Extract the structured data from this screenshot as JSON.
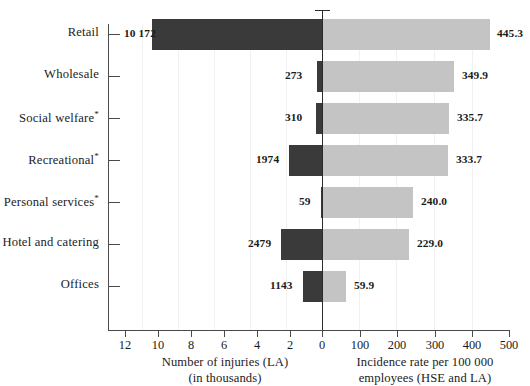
{
  "chart_data": {
    "type": "bar",
    "subtype": "bidirectional-tornado",
    "title": "",
    "categories": [
      "Retail",
      "Wholesale",
      "Social welfare*",
      "Recreational*",
      "Personal services*",
      "Hotel and catering",
      "Offices"
    ],
    "series": [
      {
        "name": "Number of injuries (LA)",
        "side": "left",
        "unit": "thousands",
        "color": "#3a3a3a",
        "values": [
          10172,
          273,
          310,
          1974,
          59,
          2479,
          1143
        ],
        "value_labels": [
          "10 172",
          "273",
          "310",
          "1974",
          "59",
          "2479",
          "1143"
        ],
        "axis_values_thousands": [
          10.172,
          0.273,
          0.31,
          1.974,
          0.059,
          2.479,
          1.143
        ]
      },
      {
        "name": "Incidence rate per 100 000 employees (HSE and LA)",
        "side": "right",
        "unit": "per 100 000 employees",
        "color": "#c4c4c4",
        "values": [
          445.3,
          349.9,
          335.7,
          333.7,
          240.0,
          229.0,
          59.9
        ],
        "value_labels": [
          "445.3",
          "349.9",
          "335.7",
          "333.7",
          "240.0",
          "229.0",
          "59.9"
        ]
      }
    ],
    "left_axis": {
      "label_line1": "Number of injuries (LA)",
      "label_line2": "(in thousands)",
      "ticks": [
        12,
        10,
        8,
        6,
        4,
        2,
        0
      ],
      "tick_labels": [
        "12",
        "10",
        "8",
        "6",
        "4",
        "2",
        "0"
      ],
      "range": [
        12,
        0
      ],
      "direction": "reversed"
    },
    "right_axis": {
      "label_line1": "Incidence rate per 100 000",
      "label_line2": "employees (HSE and LA)",
      "ticks": [
        0,
        100,
        200,
        300,
        400,
        500
      ],
      "tick_labels": [
        "0",
        "100",
        "200",
        "300",
        "400",
        "500"
      ],
      "range": [
        0,
        500
      ],
      "direction": "normal"
    },
    "grid": false,
    "legend": "none",
    "footnote_marker": "*"
  },
  "colors": {
    "bar_left": "#3a3a3a",
    "bar_right": "#c4c4c4",
    "axis": "#4a4a4a",
    "zero_line": "#2b2b2b",
    "text": "#1b1b1b",
    "background": "#ffffff"
  }
}
